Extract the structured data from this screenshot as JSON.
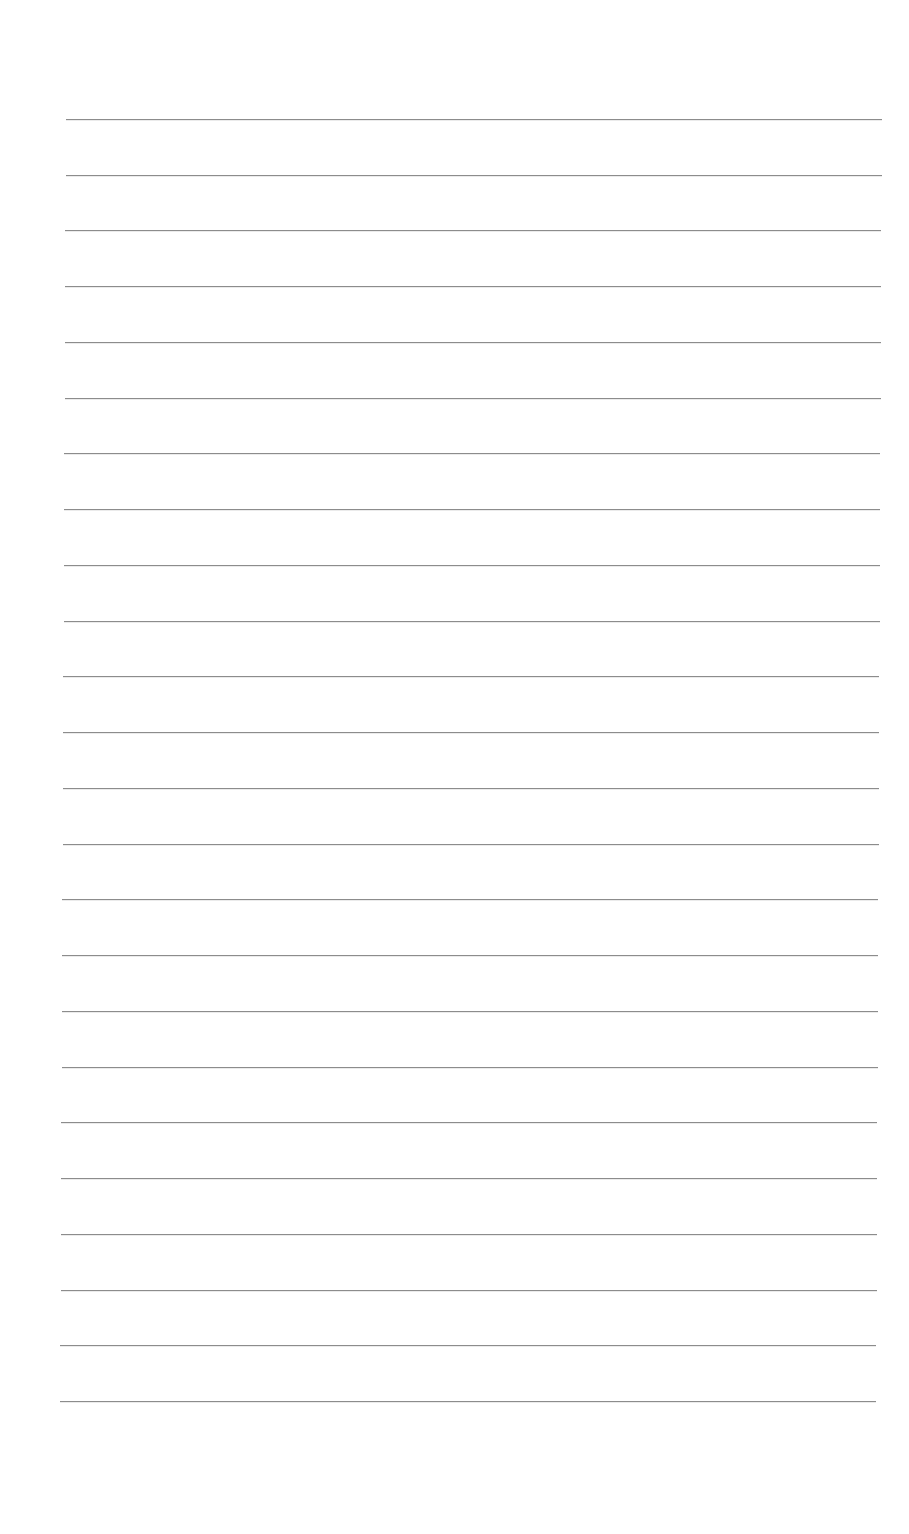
{
  "page": {
    "type": "lined-paper",
    "background_color": "#ffffff",
    "line_color": "#8c8c8c",
    "line_count": 24,
    "first_line_y": 119,
    "last_line_y": 1401,
    "line_left_start": 66,
    "line_left_end": 60,
    "line_right_start": 882,
    "line_right_end": 876,
    "text": ""
  }
}
